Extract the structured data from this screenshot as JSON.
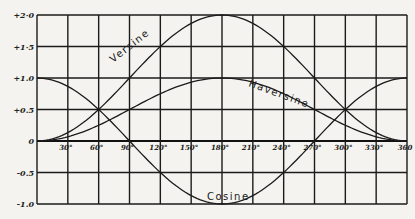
{
  "chart_data": {
    "type": "line",
    "title": "",
    "xlabel": "",
    "ylabel": "",
    "x_unit": "degrees",
    "xlim": [
      0,
      360
    ],
    "ylim": [
      -1.0,
      2.0
    ],
    "grid": true,
    "legend": "inline labels on curves",
    "x_ticks": [
      30,
      60,
      90,
      120,
      150,
      180,
      210,
      240,
      270,
      300,
      330,
      360
    ],
    "x_tick_labels": [
      "30°",
      "60°",
      "90°",
      "120°",
      "150°",
      "180°",
      "210°",
      "240°",
      "270°",
      "300°",
      "330°",
      "360"
    ],
    "y_ticks": [
      2.0,
      1.5,
      1.0,
      0.5,
      0,
      -0.5,
      -1.0
    ],
    "y_tick_labels": [
      "+2·0",
      "+1·5",
      "+1.0",
      "+0.5",
      "0",
      "-0.5",
      "-1.0"
    ],
    "x": [
      0,
      30,
      60,
      90,
      120,
      150,
      180,
      210,
      240,
      270,
      300,
      330,
      360
    ],
    "series": [
      {
        "name": "Versine",
        "formula": "1 - cos(x)",
        "values": [
          0,
          0.134,
          0.5,
          1.0,
          1.5,
          1.866,
          2.0,
          1.866,
          1.5,
          1.0,
          0.5,
          0.134,
          0
        ]
      },
      {
        "name": "Haversine",
        "formula": "(1 - cos(x)) / 2",
        "values": [
          0,
          0.067,
          0.25,
          0.5,
          0.75,
          0.933,
          1.0,
          0.933,
          0.75,
          0.5,
          0.25,
          0.067,
          0
        ]
      },
      {
        "name": "Cosine",
        "formula": "cos(x)",
        "values": [
          1.0,
          0.866,
          0.5,
          0,
          -0.5,
          -0.866,
          -1.0,
          -0.866,
          -0.5,
          0,
          0.5,
          0.866,
          1.0
        ]
      }
    ],
    "annotations": [
      {
        "text": "Versine",
        "near_x": 110,
        "near_y": 1.4
      },
      {
        "text": "Haversine",
        "near_x": 245,
        "near_y": 0.8
      },
      {
        "text": "Cosine",
        "near_x": 180,
        "near_y": -0.85
      }
    ]
  },
  "plot": {
    "left": 37,
    "right": 407,
    "top": 15,
    "bottom": 204,
    "colors": {
      "background": "#f4f3ef",
      "ink": "#1a1a1a"
    }
  }
}
